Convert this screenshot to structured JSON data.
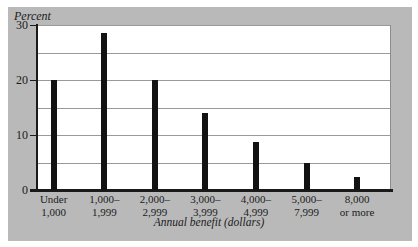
{
  "chart_data": {
    "type": "bar",
    "title": "",
    "xlabel": "Annual benefit (dollars)",
    "ylabel": "Percent",
    "ylim": [
      0,
      30
    ],
    "yticks": [
      0,
      10,
      20,
      30
    ],
    "gridlines": [
      5,
      10,
      15,
      20,
      25,
      30
    ],
    "grid": true,
    "legend": "none",
    "categories": [
      "Under\n1,000",
      "1,000–\n1,999",
      "2,000–\n2,999",
      "3,000–\n3,999",
      "4,000–\n4,999",
      "5,000–\n7,999",
      "8,000\nor more"
    ],
    "values": [
      20,
      28.5,
      20,
      14,
      8.7,
      5,
      2.3
    ],
    "series": [
      {
        "name": "Percent of beneficiaries",
        "values": [
          20,
          28.5,
          20,
          14,
          8.7,
          5,
          2.3
        ]
      }
    ],
    "colors": {
      "bar": "#121212",
      "panel_background": "#b9b9b9",
      "plot_background": "#ffffff",
      "grid": "#9a9a9a",
      "axis": "#1a1a1a",
      "text": "#1b1b1b"
    }
  },
  "axes": {
    "y_title": "Percent",
    "x_title": "Annual benefit (dollars)",
    "y_tick_labels": [
      "30",
      "20",
      "10",
      "0"
    ]
  }
}
